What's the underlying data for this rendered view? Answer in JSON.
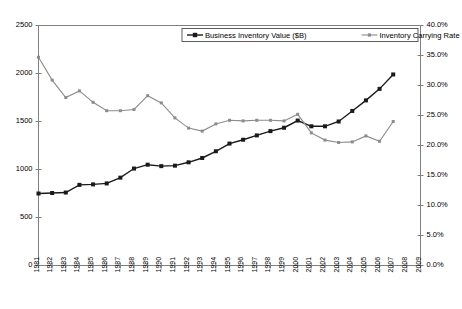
{
  "chart_data": {
    "type": "line",
    "title": "",
    "xlabel": "",
    "ylabel": "",
    "y2label": "",
    "grid": false,
    "legend_position": "top-center",
    "x": [
      1981,
      1982,
      1983,
      1984,
      1985,
      1986,
      1987,
      1988,
      1989,
      1990,
      1991,
      1992,
      1993,
      1994,
      1995,
      1996,
      1997,
      1998,
      1999,
      2000,
      2001,
      2002,
      2003,
      2004,
      2005,
      2006,
      2007
    ],
    "xtick_labels": [
      "1981",
      "1982",
      "1983",
      "1984",
      "1985",
      "1986",
      "1987",
      "1988",
      "1989",
      "1990",
      "1991",
      "1992",
      "1993",
      "1994",
      "1995",
      "1996",
      "1997",
      "1998",
      "1999",
      "2000",
      "2001",
      "2002",
      "2003",
      "2004",
      "2005",
      "2006",
      "2007",
      "2008",
      "2009"
    ],
    "xlim": [
      1981,
      2009
    ],
    "ylim": [
      0,
      2500
    ],
    "ytick_labels": [
      "0",
      "500",
      "1000",
      "1500",
      "2000",
      "2500"
    ],
    "ytick_values": [
      0,
      500,
      1000,
      1500,
      2000,
      2500
    ],
    "y2lim": [
      0,
      40
    ],
    "y2tick_labels": [
      "0.0%",
      "5.0%",
      "10.0%",
      "15.0%",
      "20.0%",
      "25.0%",
      "30.0%",
      "35.0%",
      "40.0%"
    ],
    "y2tick_values": [
      0,
      5,
      10,
      15,
      20,
      25,
      30,
      35,
      40
    ],
    "series": [
      {
        "name": "Business Inventory Value ($B)",
        "axis": "left",
        "color": "#1a1a1a",
        "marker": "square",
        "values": [
          750,
          755,
          760,
          840,
          845,
          855,
          915,
          1010,
          1050,
          1035,
          1040,
          1075,
          1120,
          1190,
          1270,
          1310,
          1355,
          1400,
          1435,
          1510,
          1450,
          1450,
          1500,
          1610,
          1720,
          1840,
          1990
        ]
      },
      {
        "name": "Inventory Carrying Rate",
        "axis": "right",
        "color": "#8c8c8c",
        "marker": "square",
        "values": [
          34.7,
          30.9,
          28.0,
          29.1,
          27.2,
          25.8,
          25.8,
          26.0,
          28.3,
          27.1,
          24.6,
          22.9,
          22.4,
          23.6,
          24.2,
          24.1,
          24.2,
          24.2,
          24.1,
          25.2,
          22.1,
          20.9,
          20.5,
          20.6,
          21.6,
          20.7,
          24.0
        ]
      }
    ]
  },
  "legend": {
    "items": [
      {
        "label": "Business Inventory Value ($B)",
        "color": "#1a1a1a"
      },
      {
        "label": "Inventory Carrying Rate",
        "color": "#8c8c8c"
      }
    ]
  }
}
